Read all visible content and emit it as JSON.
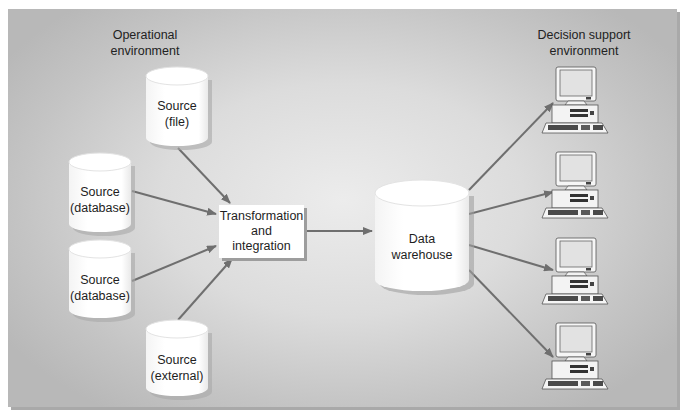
{
  "diagram": {
    "left_heading": {
      "line1": "Operational",
      "line2": "environment"
    },
    "right_heading": {
      "line1": "Decision support",
      "line2": "environment"
    },
    "sources": [
      {
        "id": "source-file",
        "line1": "Source",
        "line2": "(file)"
      },
      {
        "id": "source-database-1",
        "line1": "Source",
        "line2": "(database)"
      },
      {
        "id": "source-database-2",
        "line1": "Source",
        "line2": "(database)"
      },
      {
        "id": "source-external",
        "line1": "Source",
        "line2": "(external)"
      }
    ],
    "transformation": {
      "line1": "Transformation",
      "line2": "and",
      "line3": "integration"
    },
    "warehouse": {
      "line1": "Data",
      "line2": "warehouse"
    },
    "clients": [
      {
        "id": "workstation-1",
        "icon": "desktop-computer-icon"
      },
      {
        "id": "workstation-2",
        "icon": "desktop-computer-icon"
      },
      {
        "id": "workstation-3",
        "icon": "desktop-computer-icon"
      },
      {
        "id": "workstation-4",
        "icon": "desktop-computer-icon"
      }
    ],
    "edges": [
      {
        "from": "Source (file)",
        "to": "Transformation and integration"
      },
      {
        "from": "Source (database)",
        "to": "Transformation and integration"
      },
      {
        "from": "Source (database)",
        "to": "Transformation and integration"
      },
      {
        "from": "Source (external)",
        "to": "Transformation and integration"
      },
      {
        "from": "Transformation and integration",
        "to": "Data warehouse"
      },
      {
        "from": "Data warehouse",
        "to": "workstation-1"
      },
      {
        "from": "Data warehouse",
        "to": "workstation-2"
      },
      {
        "from": "Data warehouse",
        "to": "workstation-3"
      },
      {
        "from": "Data warehouse",
        "to": "workstation-4"
      }
    ],
    "colors": {
      "arrow": "#6f6f6f",
      "background_center": "#ececec",
      "background_edge": "#b8b8b8",
      "node_fill": "#ffffff"
    }
  }
}
